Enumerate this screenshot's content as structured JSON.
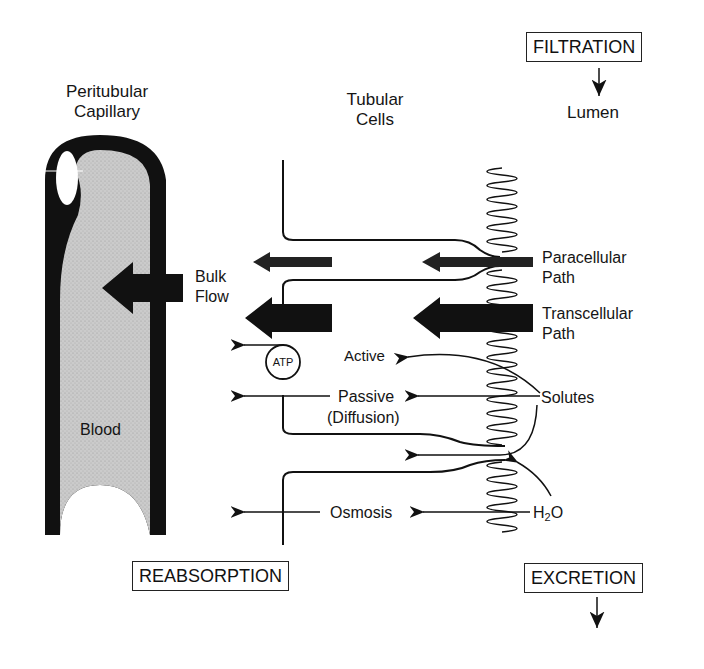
{
  "diagram": {
    "colors": {
      "ink": "#111111",
      "blood_fill": "#c9c9c9",
      "background": "#ffffff"
    },
    "headers": {
      "capillary": [
        "Peritubular",
        "Capillary"
      ],
      "cells": [
        "Tubular",
        "Cells"
      ],
      "lumen": "Lumen"
    },
    "boxes": {
      "filtration": "FILTRATION",
      "reabsorption": "REABSORPTION",
      "excretion": "EXCRETION"
    },
    "labels": {
      "bulk_flow": [
        "Bulk",
        "Flow"
      ],
      "blood": "Blood",
      "paracellular": [
        "Paracellular",
        "Path"
      ],
      "transcellular": [
        "Transcellular",
        "Path"
      ],
      "atp": "ATP",
      "active": "Active",
      "passive": "Passive",
      "diffusion": "(Diffusion)",
      "solutes": "Solutes",
      "osmosis": "Osmosis",
      "water_main": "H",
      "water_sub": "2",
      "water_end": "O"
    },
    "icons": {
      "filtration_arrow": "arrow-down-icon",
      "excretion_arrow": "arrow-down-icon",
      "bulk_flow_arrow": "thick-arrow-left-icon",
      "atp_pump": "circle-icon",
      "brush_border": "microvilli-wave-icon"
    }
  }
}
